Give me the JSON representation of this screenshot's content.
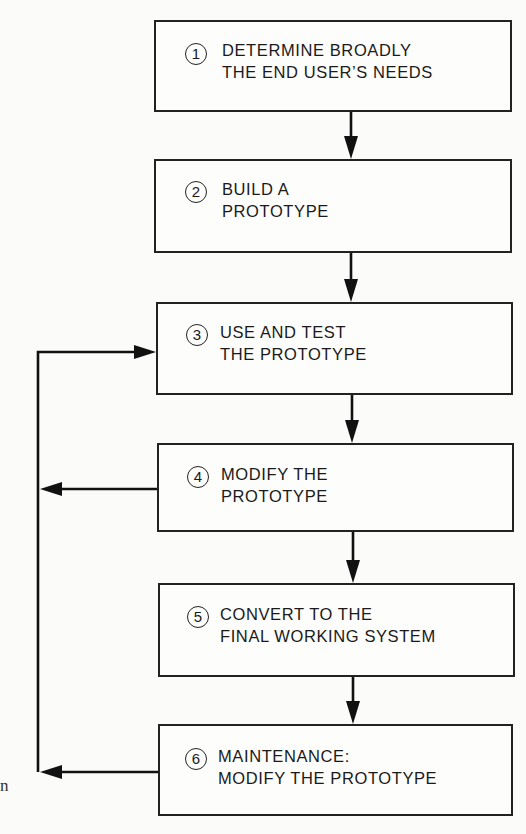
{
  "diagram": {
    "type": "flowchart",
    "steps": [
      {
        "number": "1",
        "line1": "DETERMINE BROADLY",
        "line2": "THE END USER’S NEEDS"
      },
      {
        "number": "2",
        "line1": "BUILD A",
        "line2": "PROTOTYPE"
      },
      {
        "number": "3",
        "line1": "USE AND TEST",
        "line2": "THE PROTOTYPE"
      },
      {
        "number": "4",
        "line1": "MODIFY THE",
        "line2": "PROTOTYPE"
      },
      {
        "number": "5",
        "line1": "CONVERT TO THE",
        "line2": "FINAL WORKING SYSTEM"
      },
      {
        "number": "6",
        "line1": "MAINTENANCE:",
        "line2": "MODIFY THE PROTOTYPE"
      }
    ],
    "edges": [
      {
        "from": "1",
        "to": "2"
      },
      {
        "from": "2",
        "to": "3"
      },
      {
        "from": "3",
        "to": "4"
      },
      {
        "from": "4",
        "to": "5"
      },
      {
        "from": "5",
        "to": "6"
      },
      {
        "from": "4",
        "to": "3",
        "kind": "feedback-loop"
      },
      {
        "from": "6",
        "to": "3",
        "kind": "feedback-loop"
      }
    ],
    "margin_fragment": "n",
    "colors": {
      "line": "#111111",
      "background": "#fbfbf9"
    }
  }
}
